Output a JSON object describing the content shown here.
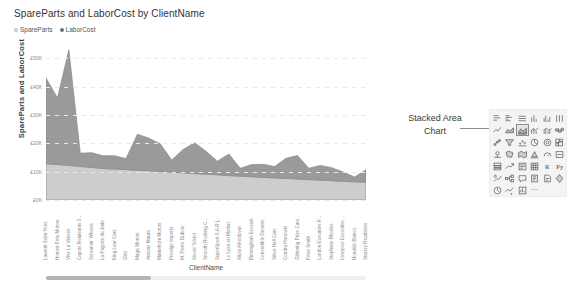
{
  "chart_data": {
    "type": "area",
    "stacked": true,
    "title": "SpareParts and LaborCost by ClientName",
    "xlabel": "ClientName",
    "ylabel": "SpareParts and LaborCost",
    "ylim": [
      0,
      55000
    ],
    "grid": true,
    "legend_position": "top-left",
    "ytick_labels": [
      "£50K",
      "£40K",
      "£30K",
      "£20K",
      "£10K",
      "£0K"
    ],
    "ytick_values": [
      50000,
      40000,
      30000,
      20000,
      10000,
      0
    ],
    "categories": [
      "Laurent Saint Yves",
      "Honest Pete Motors",
      "Vive La Vitesse",
      "Capots Reluisants S...",
      "Screamin' Wheels",
      "La Pagode du Jade",
      "King Lear Cars",
      "Glitz",
      "Magic Motors",
      "Antonio Maura",
      "Matterhorn Motors",
      "Prestige Imports",
      "M. Pierre Dubois",
      "Alexei Tolstoi",
      "Smooth Rocking C...",
      "SuperSport S.A.R.L.",
      "Le Luxe en Motion",
      "Alicia Almodovar",
      "Birmingham Executi...",
      "Convertible Dreams",
      "Silver Hall Cars",
      "Condra Horowitz",
      "Glittering Prize Cars...",
      "Peter Smith",
      "London Executive P...",
      "Stephany Rhodes",
      "Liverpool Executive ...",
      "Ronaldo Bianco",
      "Snazzy Roadsters"
    ],
    "series": [
      {
        "name": "SpareParts",
        "color": "#cdcdcd",
        "values": [
          12800,
          12500,
          12200,
          11800,
          11500,
          11100,
          10900,
          10700,
          10500,
          10300,
          10000,
          9800,
          9600,
          9300,
          9100,
          8900,
          8600,
          8400,
          8200,
          8000,
          7800,
          7600,
          7400,
          7200,
          7000,
          6800,
          6600,
          6400,
          6300
        ]
      },
      {
        "name": "LaborCost",
        "color": "#9a9a9a",
        "values": [
          30200,
          23500,
          40800,
          4700,
          5200,
          4500,
          4700,
          3900,
          12700,
          11500,
          9800,
          4300,
          8200,
          10900,
          8100,
          4800,
          7600,
          2800,
          4300,
          4600,
          4000,
          7100,
          8300,
          4000,
          5200,
          4600,
          3300,
          1700,
          4400
        ]
      }
    ]
  },
  "legend": [
    {
      "label": "SpareParts",
      "color": "#c9c9c9"
    },
    {
      "label": "LaborCost",
      "color": "#707070"
    }
  ],
  "annotation": {
    "line1": "Stacked Area",
    "line2": "Chart"
  },
  "viz_pane": {
    "icons": [
      {
        "name": "stacked-bar-chart-icon",
        "glyph": "bars-h"
      },
      {
        "name": "clustered-bar-chart-icon",
        "glyph": "bars-h2"
      },
      {
        "name": "hundred-stacked-bar-chart-icon",
        "glyph": "bars-h3"
      },
      {
        "name": "stacked-column-chart-icon",
        "glyph": "bars-v"
      },
      {
        "name": "clustered-column-chart-icon",
        "glyph": "bars-v2"
      },
      {
        "name": "hundred-stacked-column-chart-icon",
        "glyph": "bars-v3"
      },
      {
        "name": "line-chart-icon",
        "glyph": "line"
      },
      {
        "name": "area-chart-icon",
        "glyph": "area"
      },
      {
        "name": "stacked-area-chart-icon",
        "glyph": "stacked-area",
        "selected": true
      },
      {
        "name": "line-and-stacked-column-chart-icon",
        "glyph": "combo"
      },
      {
        "name": "line-and-clustered-column-chart-icon",
        "glyph": "combo2"
      },
      {
        "name": "ribbon-chart-icon",
        "glyph": "ribbon"
      },
      {
        "name": "waterfall-chart-icon",
        "glyph": "waterfall"
      },
      {
        "name": "funnel-chart-icon",
        "glyph": "funnel"
      },
      {
        "name": "scatter-chart-icon",
        "glyph": "scatter"
      },
      {
        "name": "pie-chart-icon",
        "glyph": "pie"
      },
      {
        "name": "donut-chart-icon",
        "glyph": "donut"
      },
      {
        "name": "treemap-icon",
        "glyph": "treemap"
      },
      {
        "name": "map-icon",
        "glyph": "map"
      },
      {
        "name": "filled-map-icon",
        "glyph": "filled-map"
      },
      {
        "name": "shape-map-icon",
        "glyph": "shape-map"
      },
      {
        "name": "azure-map-icon",
        "glyph": "azure-map"
      },
      {
        "name": "gauge-icon",
        "glyph": "gauge"
      },
      {
        "name": "card-icon",
        "glyph": "card"
      },
      {
        "name": "multi-row-card-icon",
        "glyph": "multirow-card"
      },
      {
        "name": "kpi-icon",
        "glyph": "kpi"
      },
      {
        "name": "slicer-icon",
        "glyph": "slicer"
      },
      {
        "name": "table-icon",
        "glyph": "table"
      },
      {
        "name": "r-script-visual-icon",
        "glyph": "R"
      },
      {
        "name": "python-visual-icon",
        "glyph": "Py"
      },
      {
        "name": "key-influencers-icon",
        "glyph": "key-influencers"
      },
      {
        "name": "decomposition-tree-icon",
        "glyph": "decomp-tree"
      },
      {
        "name": "qna-icon",
        "glyph": "qna"
      },
      {
        "name": "smart-narrative-icon",
        "glyph": "narrative"
      },
      {
        "name": "paginated-report-icon",
        "glyph": "paginated"
      },
      {
        "name": "power-apps-icon",
        "glyph": "powerapps"
      },
      {
        "name": "metrics-icon",
        "glyph": "metrics"
      },
      {
        "name": "get-more-visuals-icon",
        "glyph": "more-visuals"
      },
      {
        "name": "build-visual-icon",
        "glyph": "build"
      },
      {
        "name": "more-options-icon",
        "glyph": "..."
      }
    ]
  }
}
